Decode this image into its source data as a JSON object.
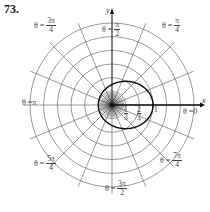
{
  "problem_number": "73.",
  "graph": {
    "type": "polar",
    "center_px": [
      112,
      105
    ],
    "unit_px": 41,
    "grid_circle_step": 0.3333,
    "grid_circle_count": 6,
    "radial_line_count": 16,
    "curve": "r = 1/(2 - cos θ)",
    "curve_color": "#111111",
    "grid_color": "#555555"
  },
  "axes": {
    "x_label": "x",
    "y_label": "y"
  },
  "angle_labels": [
    {
      "id": "theta-0",
      "prefix": "θ = ",
      "text": "0"
    },
    {
      "id": "theta-pi-4",
      "prefix": "θ = ",
      "num": "π",
      "den": "4"
    },
    {
      "id": "theta-pi-2",
      "prefix": "θ = ",
      "num": "π",
      "den": "2"
    },
    {
      "id": "theta-3pi-4",
      "prefix": "θ = ",
      "num": "3π",
      "den": "4"
    },
    {
      "id": "theta-pi",
      "prefix": "θ = ",
      "text": "π"
    },
    {
      "id": "theta-5pi-4",
      "prefix": "θ = ",
      "num": "5π",
      "den": "4"
    },
    {
      "id": "theta-3pi-2",
      "prefix": "θ = ",
      "num": "3π",
      "den": "2"
    },
    {
      "id": "theta-7pi-4",
      "prefix": "θ = ",
      "num": "7π",
      "den": "4"
    }
  ],
  "radial_ticks": [
    {
      "num": "1",
      "den": "3"
    },
    {
      "num": "2",
      "den": "3"
    },
    {
      "text": "1"
    }
  ]
}
